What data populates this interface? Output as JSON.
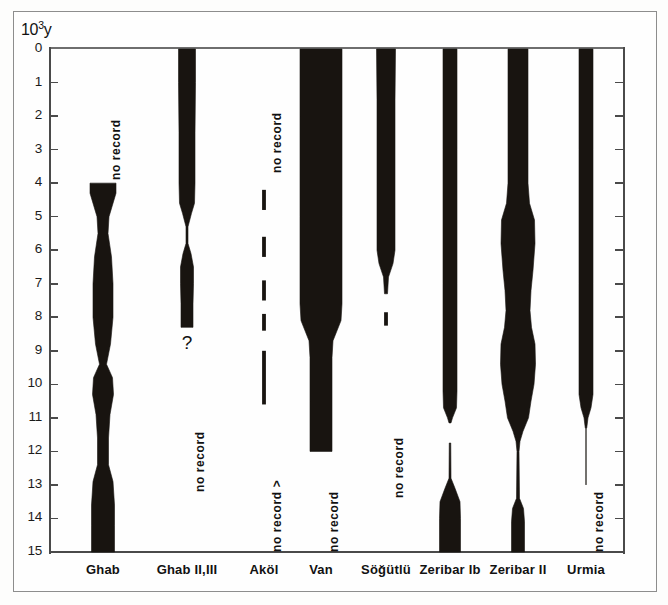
{
  "figure": {
    "y_axis_unit_label": "10",
    "y_axis_unit_exponent": "3",
    "y_axis_unit_suffix": "y"
  },
  "chart_data": {
    "type": "area",
    "title": "",
    "subtitle": "",
    "xlabel": "",
    "ylabel": "10³ y",
    "ylim": [
      0,
      15
    ],
    "y_inverted": true,
    "grid": false,
    "legend": "none",
    "y_tick_labels": [
      "0",
      "1",
      "2",
      "3",
      "4",
      "5",
      "6",
      "7",
      "8",
      "9",
      "10",
      "11",
      "12",
      "13",
      "14",
      "15"
    ],
    "y_ticks": [
      0,
      1,
      2,
      3,
      4,
      5,
      6,
      7,
      8,
      9,
      10,
      11,
      12,
      13,
      14,
      15
    ],
    "categories": [
      "Ghab",
      "Ghab II,III",
      "Aköl",
      "Van",
      "Söğütlü",
      "Zeribar Ib",
      "Zeribar II",
      "Urmia"
    ],
    "series": [
      {
        "name": "Ghab",
        "label": "Ghab",
        "style": "silhouette",
        "record_start": 4.0,
        "record_end": 15.0,
        "no_record_label": "no record",
        "no_record_range": [
          0.6,
          3.9
        ],
        "profile": [
          {
            "y": 4.0,
            "width": 26
          },
          {
            "y": 4.3,
            "width": 26
          },
          {
            "y": 5.0,
            "width": 12
          },
          {
            "y": 5.5,
            "width": 10
          },
          {
            "y": 6.2,
            "width": 17
          },
          {
            "y": 7.0,
            "width": 20
          },
          {
            "y": 8.0,
            "width": 20
          },
          {
            "y": 8.8,
            "width": 15
          },
          {
            "y": 9.4,
            "width": 7
          },
          {
            "y": 9.8,
            "width": 19
          },
          {
            "y": 10.3,
            "width": 21
          },
          {
            "y": 10.9,
            "width": 14
          },
          {
            "y": 11.6,
            "width": 11
          },
          {
            "y": 12.4,
            "width": 11
          },
          {
            "y": 12.9,
            "width": 20
          },
          {
            "y": 13.6,
            "width": 23
          },
          {
            "y": 14.2,
            "width": 23
          },
          {
            "y": 15.0,
            "width": 23
          }
        ]
      },
      {
        "name": "Ghab II,III",
        "label": "Ghab II,III",
        "style": "silhouette",
        "record_start": 0.0,
        "record_end": 8.3,
        "no_record_label": "no record",
        "no_record_range": [
          9.4,
          13.2
        ],
        "uncertainty_marker": "?",
        "uncertainty_y": 8.8,
        "profile": [
          {
            "y": 0.0,
            "width": 17
          },
          {
            "y": 1.0,
            "width": 17
          },
          {
            "y": 2.5,
            "width": 16
          },
          {
            "y": 4.0,
            "width": 16
          },
          {
            "y": 4.6,
            "width": 15
          },
          {
            "y": 4.9,
            "width": 9
          },
          {
            "y": 5.3,
            "width": 2
          },
          {
            "y": 5.8,
            "width": 2
          },
          {
            "y": 6.1,
            "width": 8
          },
          {
            "y": 6.5,
            "width": 13
          },
          {
            "y": 7.0,
            "width": 13
          },
          {
            "y": 7.6,
            "width": 12
          },
          {
            "y": 8.3,
            "width": 12
          }
        ]
      },
      {
        "name": "Aköl",
        "label": "Aköl",
        "style": "dashed-line",
        "record_start": 4.2,
        "record_end": 10.6,
        "no_record_label": "no record",
        "no_record_range": [
          0.6,
          3.7
        ],
        "no_record_label_2": "no record >",
        "no_record_range_2": [
          12.3,
          15.0
        ],
        "dashes": [
          {
            "from": 4.2,
            "to": 4.8
          },
          {
            "from": 5.6,
            "to": 6.2
          },
          {
            "from": 6.9,
            "to": 7.5
          },
          {
            "from": 7.9,
            "to": 8.4
          },
          {
            "from": 9.0,
            "to": 10.6
          }
        ]
      },
      {
        "name": "Van",
        "label": "Van",
        "style": "silhouette",
        "record_start": 0.0,
        "record_end": 12.0,
        "no_record_label": "no record",
        "no_record_range": [
          12.6,
          15.0
        ],
        "profile": [
          {
            "y": 0.0,
            "width": 42
          },
          {
            "y": 2.0,
            "width": 42
          },
          {
            "y": 5.0,
            "width": 42
          },
          {
            "y": 7.6,
            "width": 42
          },
          {
            "y": 8.1,
            "width": 40
          },
          {
            "y": 8.7,
            "width": 24
          },
          {
            "y": 9.2,
            "width": 22
          },
          {
            "y": 10.5,
            "width": 22
          },
          {
            "y": 12.0,
            "width": 22
          }
        ]
      },
      {
        "name": "Söğütlü",
        "label": "Söğütlü",
        "style": "silhouette",
        "record_start": 0.0,
        "record_end": 8.2,
        "no_record_label": "no record",
        "no_record_range": [
          9.8,
          13.4
        ],
        "profile": [
          {
            "y": 0.0,
            "width": 19
          },
          {
            "y": 1.5,
            "width": 18
          },
          {
            "y": 4.0,
            "width": 18
          },
          {
            "y": 6.0,
            "width": 18
          },
          {
            "y": 6.4,
            "width": 14
          },
          {
            "y": 6.8,
            "width": 5
          },
          {
            "y": 7.3,
            "width": 3
          }
        ],
        "dashes": [
          {
            "from": 7.85,
            "to": 8.25
          }
        ]
      },
      {
        "name": "Zeribar Ib",
        "label": "Zeribar Ib",
        "style": "silhouette",
        "record_start": 0.0,
        "record_end": 15.0,
        "profile": [
          {
            "y": 0.0,
            "width": 14
          },
          {
            "y": 3.0,
            "width": 14
          },
          {
            "y": 7.0,
            "width": 14
          },
          {
            "y": 10.2,
            "width": 14
          },
          {
            "y": 10.7,
            "width": 13
          },
          {
            "y": 11.0,
            "width": 5
          },
          {
            "y": 11.15,
            "width": 2
          }
        ],
        "profile_2": [
          {
            "y": 11.75,
            "width": 1.5
          },
          {
            "y": 12.8,
            "width": 2
          },
          {
            "y": 13.1,
            "width": 10
          },
          {
            "y": 13.5,
            "width": 20
          },
          {
            "y": 14.0,
            "width": 21
          },
          {
            "y": 15.0,
            "width": 21
          }
        ]
      },
      {
        "name": "Zeribar II",
        "label": "Zeribar II",
        "style": "silhouette",
        "record_start": 0.0,
        "record_end": 15.0,
        "profile": [
          {
            "y": 0.0,
            "width": 20
          },
          {
            "y": 2.0,
            "width": 20
          },
          {
            "y": 4.0,
            "width": 20
          },
          {
            "y": 4.6,
            "width": 23
          },
          {
            "y": 5.1,
            "width": 33
          },
          {
            "y": 5.8,
            "width": 34
          },
          {
            "y": 6.6,
            "width": 30
          },
          {
            "y": 7.2,
            "width": 26
          },
          {
            "y": 7.8,
            "width": 24
          },
          {
            "y": 8.3,
            "width": 27
          },
          {
            "y": 8.8,
            "width": 34
          },
          {
            "y": 9.4,
            "width": 35
          },
          {
            "y": 10.0,
            "width": 32
          },
          {
            "y": 10.5,
            "width": 26
          },
          {
            "y": 11.0,
            "width": 21
          },
          {
            "y": 11.4,
            "width": 10
          },
          {
            "y": 11.7,
            "width": 4
          },
          {
            "y": 12.0,
            "width": 2
          }
        ],
        "profile_2": [
          {
            "y": 12.0,
            "width": 2
          },
          {
            "y": 13.4,
            "width": 3
          },
          {
            "y": 13.7,
            "width": 11
          },
          {
            "y": 14.1,
            "width": 13
          },
          {
            "y": 15.0,
            "width": 13
          }
        ]
      },
      {
        "name": "Urmia",
        "label": "Urmia",
        "style": "silhouette",
        "record_start": 0.0,
        "record_end": 11.3,
        "no_record_label": "no record",
        "no_record_range": [
          12.3,
          15.0
        ],
        "profile": [
          {
            "y": 0.0,
            "width": 14
          },
          {
            "y": 3.0,
            "width": 14
          },
          {
            "y": 7.0,
            "width": 14
          },
          {
            "y": 10.3,
            "width": 14
          },
          {
            "y": 10.7,
            "width": 10
          },
          {
            "y": 11.0,
            "width": 4
          },
          {
            "y": 11.3,
            "width": 1.5
          }
        ],
        "tail": {
          "from": 11.3,
          "to": 13.0,
          "width": 1.2
        }
      }
    ]
  },
  "labels": {
    "no_record": "no record",
    "no_record_arrow": "no record >",
    "question_mark": "?"
  },
  "colors": {
    "silhouette": "#181410",
    "axis": "#4a4a4a",
    "frame": "#8d8d8d",
    "background": "#fefefe",
    "text": "#111111"
  }
}
